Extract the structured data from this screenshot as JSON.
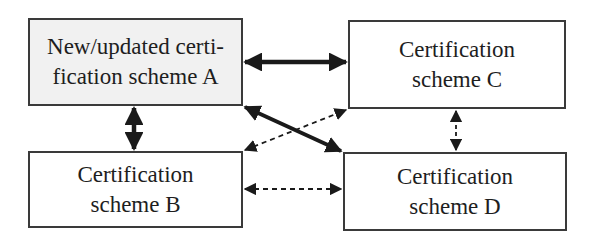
{
  "diagram": {
    "nodes": [
      {
        "id": "A",
        "lines": [
          "New/updated certi-",
          "fication scheme A"
        ],
        "fill": "#f1f1f1"
      },
      {
        "id": "B",
        "lines": [
          "Certification",
          "scheme B"
        ],
        "fill": "#ffffff"
      },
      {
        "id": "C",
        "lines": [
          "Certification",
          "scheme C"
        ],
        "fill": "#ffffff"
      },
      {
        "id": "D",
        "lines": [
          "Certification",
          "scheme D"
        ],
        "fill": "#ffffff"
      }
    ],
    "edges": [
      {
        "from": "A",
        "to": "C",
        "style": "solid-thick",
        "direction": "bidirectional"
      },
      {
        "from": "A",
        "to": "B",
        "style": "solid-thick",
        "direction": "bidirectional"
      },
      {
        "from": "A",
        "to": "D",
        "style": "solid-thick",
        "direction": "bidirectional"
      },
      {
        "from": "B",
        "to": "C",
        "style": "dashed",
        "direction": "bidirectional"
      },
      {
        "from": "C",
        "to": "D",
        "style": "dashed",
        "direction": "bidirectional"
      },
      {
        "from": "B",
        "to": "D",
        "style": "dashed",
        "direction": "bidirectional"
      }
    ],
    "colors": {
      "stroke": "#1a1a1a",
      "box_border": "#3a3a3a",
      "highlight_fill": "#f1f1f1"
    }
  }
}
